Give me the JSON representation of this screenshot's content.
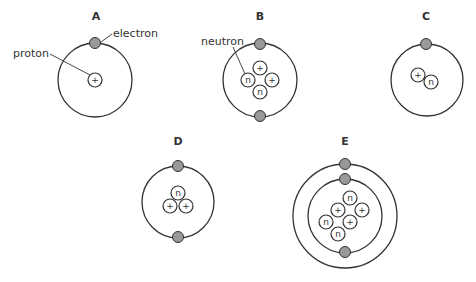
{
  "colors": {
    "stroke": "#333333",
    "electron_fill": "#999999",
    "particle_fill": "#ffffff",
    "background": "#ffffff"
  },
  "labels": {
    "electron": "electron",
    "proton": "proton",
    "neutron": "neutron"
  },
  "symbols": {
    "proton": "+",
    "neutron": "n"
  },
  "atoms": [
    {
      "id": "A",
      "title": "A",
      "title_pos": [
        96,
        20
      ],
      "center": [
        95,
        80
      ],
      "orbits": [
        37
      ],
      "electrons": [
        [
          95,
          43
        ]
      ],
      "particles": [
        {
          "type": "proton",
          "x": 95,
          "y": 80
        }
      ]
    },
    {
      "id": "B",
      "title": "B",
      "title_pos": [
        260,
        20
      ],
      "center": [
        260,
        80
      ],
      "orbits": [
        37
      ],
      "electrons": [
        [
          260,
          44
        ],
        [
          260,
          116
        ]
      ],
      "particles": [
        {
          "type": "proton",
          "x": 260,
          "y": 68
        },
        {
          "type": "neutron",
          "x": 248,
          "y": 80
        },
        {
          "type": "proton",
          "x": 272,
          "y": 80
        },
        {
          "type": "neutron",
          "x": 260,
          "y": 92
        }
      ]
    },
    {
      "id": "C",
      "title": "C",
      "title_pos": [
        426,
        20
      ],
      "center": [
        427,
        80
      ],
      "orbits": [
        36
      ],
      "electrons": [
        [
          426,
          44
        ]
      ],
      "particles": [
        {
          "type": "proton",
          "x": 418,
          "y": 75
        },
        {
          "type": "neutron",
          "x": 431,
          "y": 82
        }
      ]
    },
    {
      "id": "D",
      "title": "D",
      "title_pos": [
        178,
        145
      ],
      "center": [
        178,
        202
      ],
      "orbits": [
        36
      ],
      "electrons": [
        [
          178,
          166
        ],
        [
          178,
          237
        ]
      ],
      "particles": [
        {
          "type": "neutron",
          "x": 178,
          "y": 193
        },
        {
          "type": "proton",
          "x": 170,
          "y": 206
        },
        {
          "type": "proton",
          "x": 186,
          "y": 206
        }
      ]
    },
    {
      "id": "E",
      "title": "E",
      "title_pos": [
        345,
        145
      ],
      "center": [
        345,
        216
      ],
      "orbits": [
        52,
        37
      ],
      "electrons": [
        [
          345,
          164
        ],
        [
          345,
          179
        ],
        [
          345,
          252
        ]
      ],
      "particles": [
        {
          "type": "neutron",
          "x": 350,
          "y": 198
        },
        {
          "type": "proton",
          "x": 338,
          "y": 210
        },
        {
          "type": "proton",
          "x": 362,
          "y": 210
        },
        {
          "type": "neutron",
          "x": 326,
          "y": 222
        },
        {
          "type": "proton",
          "x": 350,
          "y": 222
        },
        {
          "type": "neutron",
          "x": 338,
          "y": 234
        }
      ]
    }
  ]
}
